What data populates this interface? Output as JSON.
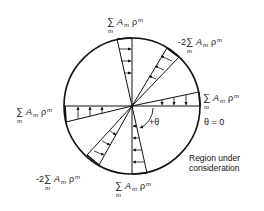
{
  "diagram": {
    "type": "circular-region-loading",
    "circle": {
      "cx": 132,
      "cy": 106,
      "r": 68
    },
    "labels": {
      "top": {
        "prefix": "",
        "sum": "∑",
        "sub": "m",
        "term": "A",
        "term_sub": "m",
        "rho": "ρ",
        "rho_sup": "m"
      },
      "upper_right": {
        "prefix": "-2",
        "sum": "∑",
        "sub": "m",
        "term": "A",
        "term_sub": "m",
        "rho": "ρ",
        "rho_sup": "m"
      },
      "right": {
        "prefix": "",
        "sum": "∑",
        "sub": "m",
        "term": "A",
        "term_sub": "m",
        "rho": "ρ",
        "rho_sup": "m"
      },
      "left": {
        "prefix": "",
        "sum": "∑",
        "sub": "m",
        "term": "A",
        "term_sub": "m",
        "rho": "ρ",
        "rho_sup": "m"
      },
      "lower_left": {
        "prefix": "-2",
        "sum": "∑",
        "sub": "m",
        "term": "A",
        "term_sub": "m",
        "rho": "ρ",
        "rho_sup": "m"
      },
      "bottom": {
        "prefix": "",
        "sum": "∑",
        "sub": "m",
        "term": "A",
        "term_sub": "m",
        "rho": "ρ",
        "rho_sup": "m"
      }
    },
    "angle_label": "+θ",
    "theta_zero_label": "θ = 0",
    "region_label_line1": "Region under",
    "region_label_line2": "consideration"
  }
}
